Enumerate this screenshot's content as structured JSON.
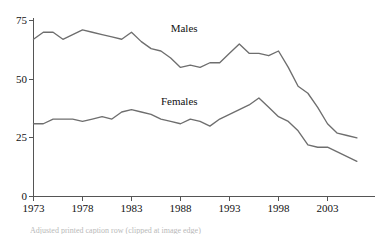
{
  "chart_data": {
    "type": "line",
    "title": "",
    "subtitle": "",
    "xlabel": "",
    "ylabel": "",
    "xlim": [
      1973,
      2006
    ],
    "ylim": [
      0,
      75
    ],
    "grid": false,
    "legend_position": "inline-labels",
    "x_ticks": [
      1973,
      1978,
      1983,
      1988,
      1993,
      1998,
      2003
    ],
    "x_tick_labels": [
      "1973",
      "1978",
      "1983",
      "1988",
      "1993",
      "1998",
      "2003"
    ],
    "y_ticks": [
      0,
      25,
      50,
      75
    ],
    "y_tick_labels": [
      "0",
      "25",
      "50",
      "75"
    ],
    "line_color": "#6e6e6e",
    "axis_color": "#555555",
    "x": [
      1973,
      1974,
      1975,
      1976,
      1977,
      1978,
      1979,
      1980,
      1981,
      1982,
      1983,
      1984,
      1985,
      1986,
      1987,
      1988,
      1989,
      1990,
      1991,
      1992,
      1993,
      1994,
      1995,
      1996,
      1997,
      1998,
      1999,
      2000,
      2001,
      2002,
      2003,
      2004,
      2005,
      2006
    ],
    "series": [
      {
        "name": "Males",
        "label": "Males",
        "label_x": 1987,
        "label_y": 70,
        "values": [
          67,
          70,
          70,
          67,
          69,
          71,
          70,
          69,
          68,
          67,
          70,
          66,
          63,
          62,
          59,
          55,
          56,
          55,
          57,
          57,
          61,
          65,
          61,
          61,
          60,
          62,
          55,
          47,
          44,
          38,
          31,
          27,
          26,
          25
        ]
      },
      {
        "name": "Females",
        "label": "Females",
        "label_x": 1986,
        "label_y": 39,
        "values": [
          31,
          31,
          33,
          33,
          33,
          32,
          33,
          34,
          33,
          36,
          37,
          36,
          35,
          33,
          32,
          31,
          33,
          32,
          30,
          33,
          35,
          37,
          39,
          42,
          38,
          34,
          32,
          28,
          22,
          21,
          21,
          19,
          17,
          15
        ]
      }
    ],
    "annotations": []
  },
  "footnote": {
    "text": "Adjusted printed caption row (clipped at image edge)"
  }
}
